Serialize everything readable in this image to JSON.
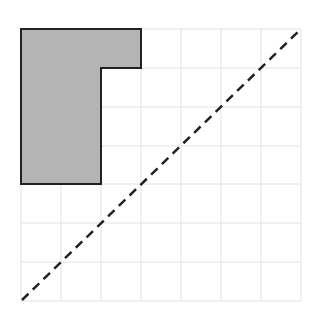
{
  "figure": {
    "width": 309,
    "height": 313,
    "background": "#ffffff",
    "grid": {
      "x_lines": [
        21,
        61,
        101,
        141,
        181,
        221,
        261,
        301
      ],
      "y_lines": [
        29,
        68,
        107,
        146,
        184,
        223,
        262,
        301
      ],
      "color": "#e2e2e2",
      "columns": 7,
      "rows": 7
    },
    "shape": {
      "type": "L-shaped polygon",
      "points": [
        [
          21,
          29
        ],
        [
          141,
          29
        ],
        [
          141,
          68
        ],
        [
          101,
          68
        ],
        [
          101,
          184
        ],
        [
          21,
          184
        ]
      ],
      "fill": "#b4b4b4",
      "stroke": "#222222",
      "stroke_width": 2
    },
    "diagonal": {
      "type": "dashed line",
      "from": [
        22,
        300
      ],
      "to": [
        301,
        29
      ],
      "color": "#222222",
      "stroke_width": 2.5,
      "dash": "9,6"
    }
  }
}
